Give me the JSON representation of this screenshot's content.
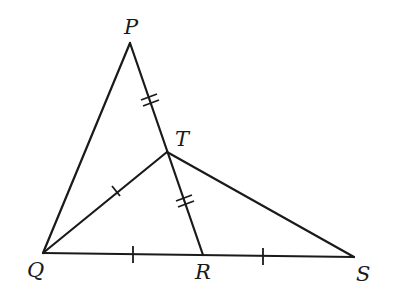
{
  "diagram": {
    "type": "geometry-figure",
    "points": {
      "P": {
        "label": "P",
        "x": 130,
        "y": 43
      },
      "T": {
        "label": "T",
        "x": 167,
        "y": 152
      },
      "Q": {
        "label": "Q",
        "x": 43,
        "y": 253
      },
      "R": {
        "label": "R",
        "x": 203,
        "y": 255
      },
      "S": {
        "label": "S",
        "x": 354,
        "y": 257
      }
    },
    "segments": [
      {
        "from": "P",
        "to": "Q"
      },
      {
        "from": "P",
        "to": "T"
      },
      {
        "from": "T",
        "to": "R"
      },
      {
        "from": "Q",
        "to": "T"
      },
      {
        "from": "T",
        "to": "S"
      },
      {
        "from": "Q",
        "to": "R"
      },
      {
        "from": "R",
        "to": "S"
      }
    ],
    "congruence_marks": [
      {
        "segment": "PT",
        "ticks": 2
      },
      {
        "segment": "TR",
        "ticks": 2
      },
      {
        "segment": "QT",
        "ticks": 1
      },
      {
        "segment": "QR",
        "ticks": 1
      },
      {
        "segment": "RS",
        "ticks": 1
      }
    ],
    "labels": {
      "P": "P",
      "T": "T",
      "Q": "Q",
      "R": "R",
      "S": "S"
    }
  }
}
